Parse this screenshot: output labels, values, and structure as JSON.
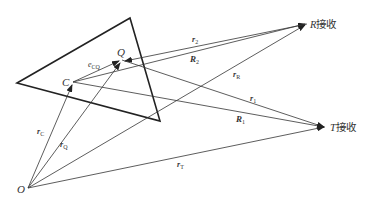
{
  "diagram": {
    "type": "vector-geometry",
    "colors": {
      "stroke": "#222222",
      "text": "#333333",
      "background": "#ffffff"
    },
    "triangle": {
      "vertices": [
        [
          17,
          83
        ],
        [
          130,
          18
        ],
        [
          160,
          121
        ]
      ]
    },
    "points": {
      "O": {
        "label": "O",
        "x": 28,
        "y": 188
      },
      "C": {
        "label": "C",
        "x": 73,
        "y": 82
      },
      "Q": {
        "label": "Q",
        "x": 122,
        "y": 60
      },
      "R": {
        "label": "R接收",
        "x": 307,
        "y": 24
      },
      "T": {
        "label": "T接收",
        "x": 326,
        "y": 127
      }
    },
    "vectors": [
      {
        "id": "rC",
        "label": "r",
        "sub": "C",
        "from": "O",
        "to": "C"
      },
      {
        "id": "rQ",
        "label": "r",
        "sub": "Q",
        "from": "O",
        "to": "Q"
      },
      {
        "id": "rR",
        "label": "r",
        "sub": "R",
        "from": "O",
        "to": "R"
      },
      {
        "id": "rT",
        "label": "r",
        "sub": "T",
        "from": "O",
        "to": "T"
      },
      {
        "id": "eCQ",
        "label": "e",
        "sub": "CQ",
        "from": "C",
        "to": "Q"
      },
      {
        "id": "r2",
        "label": "r",
        "sub": "2",
        "from": "C",
        "to": "R"
      },
      {
        "id": "R2",
        "label": "R",
        "sub": "2",
        "from": "R",
        "to": "Q"
      },
      {
        "id": "r1",
        "label": "r",
        "sub": "1",
        "from": "Q",
        "to": "T"
      },
      {
        "id": "R1",
        "label": "R",
        "sub": "1",
        "from": "C",
        "to": "T"
      }
    ]
  },
  "labels": {
    "O": "O",
    "C": "C",
    "Q": "Q",
    "R_recv_letter": "R",
    "T_recv_letter": "T",
    "recv": "接收",
    "rC_main": "r",
    "rC_sub": "C",
    "rQ_main": "r",
    "rQ_sub": "Q",
    "rR_main": "r",
    "rR_sub": "R",
    "rT_main": "r",
    "rT_sub": "T",
    "eCQ_main": "e",
    "eCQ_sub": "CQ",
    "r2_main": "r",
    "r2_sub": "2",
    "R2_main": "R",
    "R2_sub": "2",
    "r1_main": "r",
    "r1_sub": "1",
    "R1_main": "R",
    "R1_sub": "1"
  }
}
